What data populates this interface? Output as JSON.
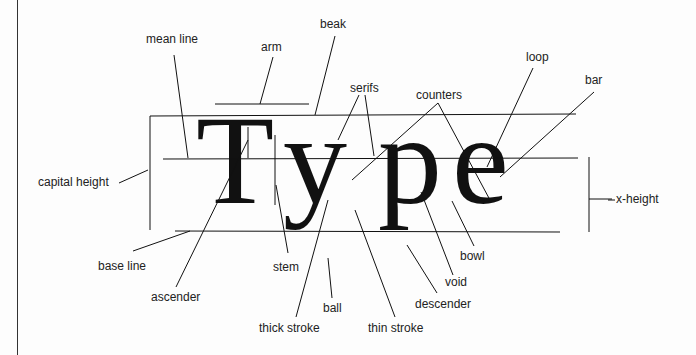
{
  "diagram": {
    "title_word": "Type",
    "letters": [
      "T",
      "y",
      "p",
      "e"
    ],
    "labels": {
      "mean_line": "mean line",
      "arm": "arm",
      "beak": "beak",
      "serifs": "serifs",
      "counters": "counters",
      "loop": "loop",
      "bar": "bar",
      "capital_height": "capital height",
      "x_height": "x-height",
      "base_line": "base line",
      "ascender": "ascender",
      "stem": "stem",
      "ball": "ball",
      "thick_stroke": "thick stroke",
      "thin_stroke": "thin stroke",
      "descender": "descender",
      "void": "void",
      "bowl": "bowl"
    },
    "colors": {
      "ink": "#111111",
      "background": "#fdfdfd"
    }
  }
}
